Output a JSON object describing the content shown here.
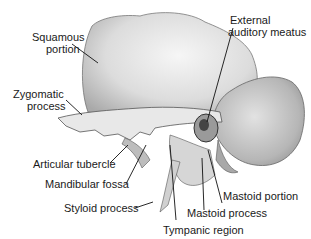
{
  "labels": {
    "squamous": [
      "Squamous",
      "portion"
    ],
    "zygomatic": [
      "Zygomatic",
      "process"
    ],
    "articular": "Articular tubercle",
    "mandibular": "Mandibular fossa",
    "styloid": "Styloid process",
    "external": [
      "External",
      "auditory meatus"
    ],
    "mastoid_portion": "Mastoid portion",
    "mastoid_process": "Mastoid process",
    "tympanic": "Tympanic region"
  },
  "colors": {
    "bone_light": "#ececec",
    "bone_mid": "#c8c8c8",
    "bone_dark": "#8a8a8a",
    "line": "#111111"
  }
}
